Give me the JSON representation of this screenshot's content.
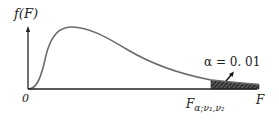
{
  "figure": {
    "type": "F-distribution density curve",
    "y_axis_label": "f(F)",
    "x_axis_label": "F",
    "origin_label": "0",
    "critical_value_label": {
      "main": "F",
      "subscript": "α;ν₁,ν₂"
    },
    "tail_annotation": "α = 0. 01",
    "colors": {
      "curve": "#6b6b6b",
      "axis": "#222222",
      "shade": "#333333"
    }
  }
}
